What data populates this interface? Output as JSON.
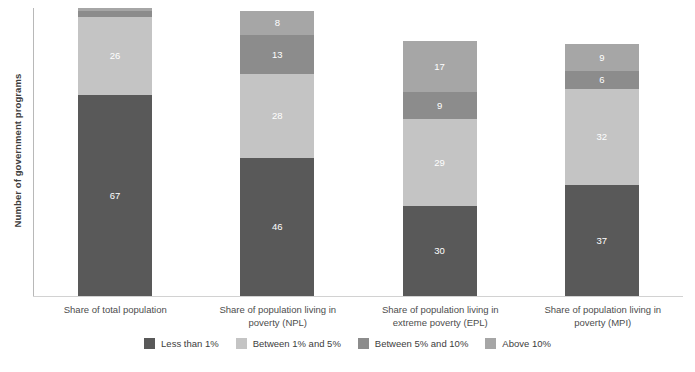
{
  "chart_data": {
    "type": "bar",
    "subtype": "stacked-bar",
    "title": "",
    "xlabel": "",
    "ylabel": "Number of government programs",
    "ylim": [
      0,
      96
    ],
    "grid": false,
    "legend_position": "bottom",
    "categories": [
      "Share of total population",
      "Share of population living in poverty (NPL)",
      "Share of population living in extreme poverty (EPL)",
      "Share of population living in poverty (MPI)"
    ],
    "series": [
      {
        "name": "Less than 1%",
        "color": "#595959",
        "values": [
          67,
          46,
          30,
          37
        ],
        "labels": [
          "67",
          "46",
          "30",
          "37"
        ]
      },
      {
        "name": "Between 1% and 5%",
        "color": "#c4c4c4",
        "values": [
          26,
          28,
          29,
          32
        ],
        "labels": [
          "26",
          "28",
          "29",
          "32"
        ]
      },
      {
        "name": "Between 5% and 10%",
        "color": "#8c8c8c",
        "values": [
          2,
          13,
          9,
          6
        ],
        "labels": [
          "",
          "13",
          "9",
          "6"
        ]
      },
      {
        "name": "Above 10%",
        "color": "#a6a6a6",
        "values": [
          1,
          8,
          17,
          9
        ],
        "labels": [
          "",
          "8",
          "17",
          "9"
        ]
      }
    ],
    "totals": [
      96,
      95,
      85,
      84
    ]
  },
  "axis": {
    "y_title": "Number of government programs"
  },
  "categories": {
    "c0_line1": "Share of total population",
    "c0_line2": "",
    "c1_line1": "Share of population living in",
    "c1_line2": "poverty (NPL)",
    "c2_line1": "Share of population living in",
    "c2_line2": "extreme poverty (EPL)",
    "c3_line1": "Share of population living in",
    "c3_line2": "poverty (MPI)"
  },
  "legend": {
    "items": [
      {
        "label": "Less than 1%",
        "color": "#595959"
      },
      {
        "label": "Between 1% and 5%",
        "color": "#c4c4c4"
      },
      {
        "label": "Between 5% and 10%",
        "color": "#8c8c8c"
      },
      {
        "label": "Above 10%",
        "color": "#a6a6a6"
      }
    ]
  },
  "bars": {
    "b0": {
      "s0": "67",
      "s1": "26",
      "s2": "",
      "s3": ""
    },
    "b1": {
      "s0": "46",
      "s1": "28",
      "s2": "13",
      "s3": "8"
    },
    "b2": {
      "s0": "30",
      "s1": "29",
      "s2": "9",
      "s3": "17"
    },
    "b3": {
      "s0": "37",
      "s1": "32",
      "s2": "6",
      "s3": "9"
    }
  }
}
